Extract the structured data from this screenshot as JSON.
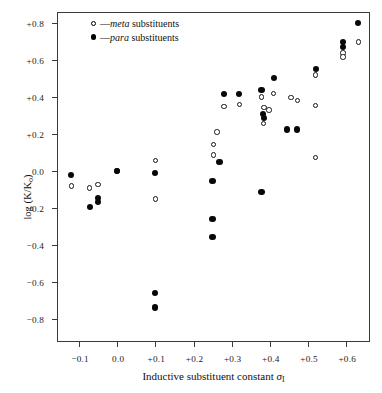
{
  "chart": {
    "type": "scatter",
    "title": "",
    "xlabel_prefix": "Inductive substituent constant ",
    "xlabel_symbol": "σ",
    "xlabel_sub": "I",
    "ylabel_main": "log (K/K",
    "ylabel_sub": "o",
    "ylabel_close": ")",
    "xlim": [
      -0.155,
      0.665
    ],
    "ylim": [
      -0.93,
      0.855
    ],
    "grid": false,
    "legend_position": "top-left-inside"
  },
  "legend": {
    "items": [
      {
        "marker": "open-circle",
        "dash": "—",
        "emphasis": "meta",
        "rest": " substituents"
      },
      {
        "marker": "filled-circle",
        "dash": "—",
        "emphasis": "para",
        "rest": " substituents"
      }
    ]
  },
  "axes": {
    "y_ticks": [
      {
        "value": 0.8,
        "label": "+0.8"
      },
      {
        "value": 0.6,
        "label": "+0.6"
      },
      {
        "value": 0.4,
        "label": "+0.4"
      },
      {
        "value": 0.2,
        "label": "+0.2"
      },
      {
        "value": 0.0,
        "label": "0.0"
      },
      {
        "value": -0.2,
        "label": "−0.2"
      },
      {
        "value": -0.4,
        "label": "−0.4"
      },
      {
        "value": -0.6,
        "label": "−0.6"
      },
      {
        "value": -0.8,
        "label": "−0.8"
      }
    ],
    "x_ticks": [
      {
        "value": -0.1,
        "label": "−0.1"
      },
      {
        "value": 0.0,
        "label": "0.0"
      },
      {
        "value": 0.1,
        "label": "+0.1"
      },
      {
        "value": 0.2,
        "label": "+0.2"
      },
      {
        "value": 0.3,
        "label": "+0.3"
      },
      {
        "value": 0.4,
        "label": "+0.4"
      },
      {
        "value": 0.5,
        "label": "+0.5"
      },
      {
        "value": 0.6,
        "label": "+0.6"
      }
    ]
  },
  "chart_data": {
    "type": "scatter",
    "title": "",
    "xlabel": "Inductive substituent constant σI",
    "ylabel": "log (K/Ko)",
    "xlim": [
      -0.155,
      0.665
    ],
    "ylim": [
      -0.93,
      0.855
    ],
    "grid": false,
    "legend": [
      "—meta substituents",
      "—para substituents"
    ],
    "series": [
      {
        "name": "meta substituents",
        "marker": "open-circle",
        "points": [
          [
            -0.12,
            -0.08
          ],
          [
            -0.072,
            -0.092
          ],
          [
            -0.05,
            -0.072
          ],
          [
            0.0,
            0.0
          ],
          [
            0.1,
            0.058
          ],
          [
            0.1,
            -0.152
          ],
          [
            0.252,
            0.088
          ],
          [
            0.252,
            0.145
          ],
          [
            0.262,
            0.212
          ],
          [
            0.28,
            0.35
          ],
          [
            0.32,
            0.36
          ],
          [
            0.378,
            0.4
          ],
          [
            0.385,
            0.345
          ],
          [
            0.383,
            0.258
          ],
          [
            0.398,
            0.33
          ],
          [
            0.41,
            0.418
          ],
          [
            0.455,
            0.398
          ],
          [
            0.472,
            0.382
          ],
          [
            0.52,
            0.52
          ],
          [
            0.52,
            0.355
          ],
          [
            0.52,
            0.075
          ],
          [
            0.592,
            0.638
          ],
          [
            0.592,
            0.618
          ],
          [
            0.632,
            0.698
          ]
        ]
      },
      {
        "name": "para substituents",
        "marker": "filled-circle",
        "points": [
          [
            -0.12,
            -0.02
          ],
          [
            -0.072,
            -0.195
          ],
          [
            -0.05,
            -0.145
          ],
          [
            -0.05,
            -0.168
          ],
          [
            0.0,
            0.0
          ],
          [
            0.1,
            -0.012
          ],
          [
            0.1,
            -0.66
          ],
          [
            0.1,
            -0.738
          ],
          [
            0.25,
            -0.055
          ],
          [
            0.25,
            -0.258
          ],
          [
            0.25,
            -0.355
          ],
          [
            0.268,
            0.05
          ],
          [
            0.28,
            0.418
          ],
          [
            0.32,
            0.418
          ],
          [
            0.378,
            0.438
          ],
          [
            0.383,
            0.308
          ],
          [
            0.385,
            0.288
          ],
          [
            0.378,
            -0.115
          ],
          [
            0.41,
            0.505
          ],
          [
            0.445,
            0.225
          ],
          [
            0.472,
            0.225
          ],
          [
            0.52,
            0.552
          ],
          [
            0.592,
            0.698
          ],
          [
            0.592,
            0.672
          ],
          [
            0.632,
            0.8
          ]
        ]
      }
    ]
  }
}
